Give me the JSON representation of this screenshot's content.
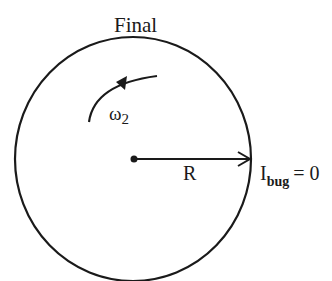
{
  "title": "Final",
  "angular_velocity_label": "ω",
  "angular_velocity_subscript": "2",
  "radius_label": "R",
  "moment_label": "I",
  "moment_subscript": "bug",
  "moment_value": "= 0",
  "colors": {
    "stroke": "#1a1a1a",
    "background": "#ffffff"
  }
}
